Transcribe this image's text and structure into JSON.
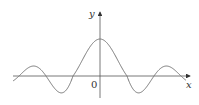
{
  "figure": {
    "type": "function-graph",
    "x_axis_label": "x",
    "y_axis_label": "y",
    "origin_label": "0",
    "colors": {
      "axes": "#333333",
      "curve": "#777777",
      "background": "#ffffff"
    }
  },
  "chart_data": {
    "type": "line",
    "title": "",
    "xlabel": "x",
    "ylabel": "y",
    "function": "sin(x)/x",
    "features": {
      "peak": {
        "x": 0,
        "y": 1
      },
      "zeros": [
        -6.28,
        -3.14,
        3.14,
        6.28
      ],
      "local_minima_x": [
        -4.49,
        4.49
      ],
      "local_maxima_x": [
        -7.73,
        7.73
      ]
    },
    "grid": false,
    "tick_labels": [
      "0"
    ]
  }
}
